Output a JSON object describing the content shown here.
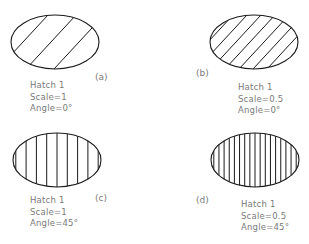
{
  "figure": {
    "panels": [
      {
        "id": "a",
        "tag": "(a)",
        "lines": [
          "Hatch  1",
          "Scale=1",
          "Angle=0°"
        ],
        "hatch": {
          "pattern": "Hatch 1",
          "scale": 1,
          "angle": 0
        },
        "ellipse": {
          "cx": 55,
          "cy": 42,
          "rx": 44,
          "ry": 27
        },
        "render": {
          "dir": "diag",
          "spacing": 28
        }
      },
      {
        "id": "b",
        "tag": "(b)",
        "lines": [
          "Hatch  1",
          "Scale=0.5",
          "Angle=0°"
        ],
        "hatch": {
          "pattern": "Hatch 1",
          "scale": 0.5,
          "angle": 0
        },
        "ellipse": {
          "cx": 254,
          "cy": 42,
          "rx": 44,
          "ry": 27
        },
        "render": {
          "dir": "diag",
          "spacing": 14
        }
      },
      {
        "id": "c",
        "tag": "(c)",
        "lines": [
          "Hatch  1",
          "Scale=1",
          "Angle=45°"
        ],
        "hatch": {
          "pattern": "Hatch 1",
          "scale": 1,
          "angle": 45
        },
        "ellipse": {
          "cx": 57,
          "cy": 160,
          "rx": 44,
          "ry": 27
        },
        "render": {
          "dir": "vert",
          "spacing": 10.3
        }
      },
      {
        "id": "d",
        "tag": "(d)",
        "lines": [
          "Hatch  1",
          "Scale=0.5",
          "Angle=45°"
        ],
        "hatch": {
          "pattern": "Hatch 1",
          "scale": 0.5,
          "angle": 45
        },
        "ellipse": {
          "cx": 255,
          "cy": 160,
          "rx": 44,
          "ry": 27
        },
        "render": {
          "dir": "vert",
          "spacing": 5.15
        }
      }
    ],
    "colors": {
      "outline": "#1a1a1a",
      "hatch": "#1a1a1a",
      "text": "#7a7a7a"
    }
  }
}
